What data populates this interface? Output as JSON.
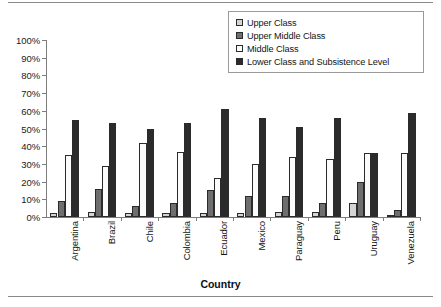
{
  "chart_data": {
    "type": "bar",
    "title": "",
    "xlabel": "Country",
    "ylabel": "",
    "ylim": [
      0,
      100
    ],
    "yticks": [
      "0%",
      "10%",
      "20%",
      "30%",
      "40%",
      "50%",
      "60%",
      "70%",
      "80%",
      "90%",
      "100%"
    ],
    "grid": false,
    "legend_position": "top-right",
    "categories": [
      "Argentina",
      "Brazil",
      "Chile",
      "Colombia",
      "Ecuador",
      "Mexico",
      "Paraguay",
      "Peru",
      "Uruguay",
      "Venezuela"
    ],
    "series": [
      {
        "name": "Upper Class",
        "color": "#d4d4d4",
        "values": [
          2,
          3,
          2,
          2,
          2,
          2,
          3,
          3,
          8,
          1
        ]
      },
      {
        "name": "Upper Middle Class",
        "color": "#6e6e6e",
        "values": [
          9,
          16,
          6,
          8,
          15,
          12,
          12,
          8,
          20,
          4
        ]
      },
      {
        "name": "Middle Class",
        "color": "#fbfbfb",
        "values": [
          35,
          29,
          42,
          37,
          22,
          30,
          34,
          33,
          36,
          36
        ]
      },
      {
        "name": "Lower Class and Subsistence Level",
        "color": "#2b2b2b",
        "values": [
          55,
          53,
          50,
          53,
          61,
          56,
          51,
          56,
          36,
          59
        ]
      }
    ]
  }
}
